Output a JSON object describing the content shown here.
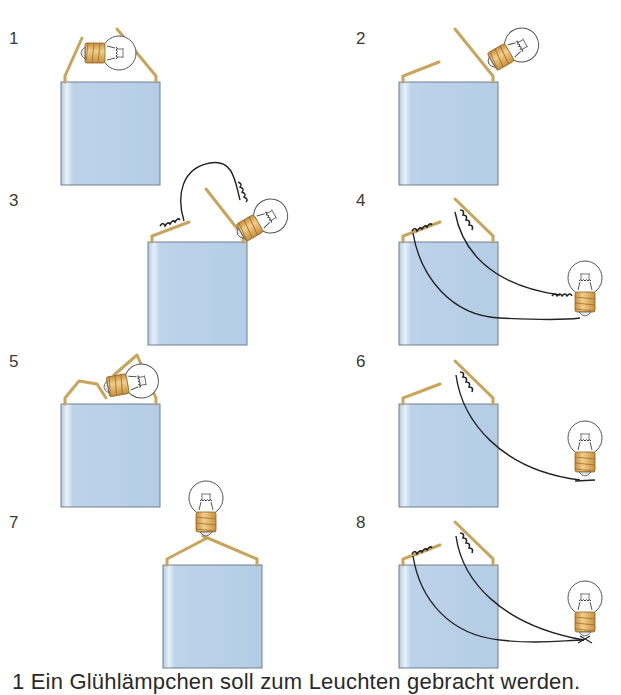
{
  "figure": {
    "panels": [
      {
        "number": "1",
        "description": "Bulb held horizontally between both battery tabs"
      },
      {
        "number": "2",
        "description": "Bulb touching only one tab"
      },
      {
        "number": "3",
        "description": "Wire from left tab to bulb base side, bulb touching right tab"
      },
      {
        "number": "4",
        "description": "Two wires from both tabs to bulb side thread and tip"
      },
      {
        "number": "5",
        "description": "Tabs bent over bulb lying on battery"
      },
      {
        "number": "6",
        "description": "One wire from right tab to bulb tip"
      },
      {
        "number": "7",
        "description": "Both tabs bent together to bulb tip"
      },
      {
        "number": "8",
        "description": "Both wires joined at bulb tip"
      }
    ],
    "caption": "1  Ein Glühlämpchen soll zum Leuchten gebracht werden."
  },
  "colors": {
    "battery_fill": "#b9d1e8",
    "battery_highlight": "#e4eef7",
    "battery_edge": "#6f7f8f",
    "tab": "#c9a45a",
    "bulb_base": "#e3b36a",
    "wire": "#222222",
    "glass": "#ffffff"
  }
}
